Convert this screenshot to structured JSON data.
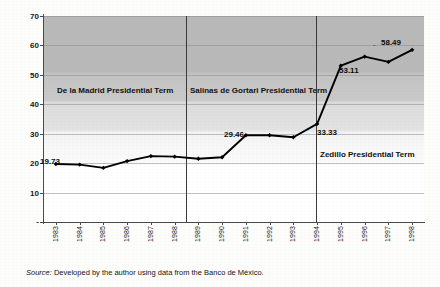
{
  "chart_data": {
    "type": "line",
    "title": "",
    "subtitle": "",
    "xlabel": "",
    "ylabel": "",
    "ylim": [
      0,
      70
    ],
    "yticks": [
      "-",
      "10",
      "20",
      "30",
      "40",
      "50",
      "60",
      "70"
    ],
    "ytick_values": [
      0,
      10,
      20,
      30,
      40,
      50,
      60,
      70
    ],
    "grid": true,
    "legend": "none",
    "categories": [
      "1983",
      "1984",
      "1985",
      "1986",
      "1987",
      "1988",
      "1989",
      "1990",
      "1991",
      "1992",
      "1993",
      "1994",
      "1995",
      "1996",
      "1997",
      "1998"
    ],
    "values": [
      19.73,
      19.5,
      18.4,
      20.7,
      22.4,
      22.2,
      21.5,
      22.0,
      29.46,
      29.5,
      28.8,
      33.33,
      53.11,
      56.2,
      54.4,
      58.49
    ],
    "series": [
      {
        "name": "series-1",
        "values": [
          19.73,
          19.5,
          18.4,
          20.7,
          22.4,
          22.2,
          21.5,
          22.0,
          29.46,
          29.5,
          28.8,
          33.33,
          53.11,
          56.2,
          54.4,
          58.49
        ],
        "color": "#000000",
        "marker": "diamond"
      }
    ],
    "point_labels": [
      {
        "category": "1983",
        "value": 19.73,
        "text": "19.73"
      },
      {
        "category": "1991",
        "value": 29.46,
        "text": "29.46"
      },
      {
        "category": "1994",
        "value": 33.33,
        "text": "33.33"
      },
      {
        "category": "1995",
        "value": 53.11,
        "text": "53.11"
      },
      {
        "category": "1998",
        "value": 58.49,
        "text": "58.49"
      }
    ],
    "annotations": [
      {
        "name": "de-la-madrid-term",
        "text": "De la Madrid Presidential Term",
        "span": [
          "1983",
          "1988"
        ]
      },
      {
        "name": "salinas-de-gortari-term",
        "text": "Salinas de Gortari Presidential Term",
        "span": [
          "1989",
          "1994"
        ]
      },
      {
        "name": "zedillo-term",
        "text": "Zedillo Presidential Term",
        "span": [
          "1995",
          "1998"
        ]
      }
    ],
    "dividers": [
      {
        "name": "divider-1988-1989",
        "between": [
          "1988",
          "1989"
        ]
      },
      {
        "name": "divider-1994-1995",
        "between": [
          "1994",
          "1995"
        ]
      }
    ]
  },
  "caption": {
    "source_word": "Source:",
    "source_text": " Developed by the author using data  from  the Banco de México."
  }
}
